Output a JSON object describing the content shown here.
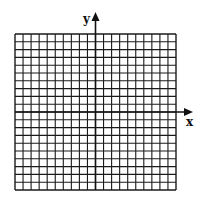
{
  "diagram": {
    "type": "coordinate-grid",
    "grid": {
      "columns": 20,
      "rows": 20,
      "left": 15,
      "top": 34,
      "right": 176,
      "bottom": 190,
      "line_color": "#1a1a1a",
      "background": "#ffffff"
    },
    "axes": {
      "x_label": "x",
      "y_label": "y",
      "origin_col": 10,
      "origin_row": 10,
      "x_arrow_tip": 193,
      "y_arrow_tip": 12,
      "color": "#111111"
    }
  }
}
